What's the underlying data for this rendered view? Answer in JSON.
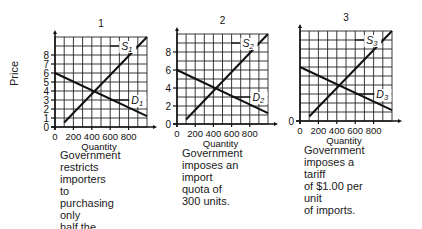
{
  "figure": {
    "y_axis_label": "Price"
  },
  "panels": [
    {
      "number": "1",
      "supply_label": "S",
      "supply_sub": "1",
      "demand_label": "D",
      "demand_sub": "1",
      "y_ticks": [
        "0",
        "1",
        "2",
        "3",
        "4",
        "5",
        "6",
        "7",
        "8"
      ],
      "x_ticks": [
        "0",
        "200",
        "400",
        "600",
        "800"
      ],
      "x_label": "Quantity",
      "caption": [
        "Government",
        "restricts importers",
        "to purchasing only",
        "half the quantity",
        "demanded at each",
        "price."
      ]
    },
    {
      "number": "2",
      "supply_label": "S",
      "supply_sub": "2",
      "demand_label": "D",
      "demand_sub": "2",
      "y_ticks": [
        "0",
        "2",
        "4",
        "6",
        "8"
      ],
      "x_ticks": [
        "0",
        "200",
        "400",
        "600",
        "800"
      ],
      "x_label": "Quantity",
      "caption": [
        "Government",
        "imposes an import",
        "quota of 300 units."
      ]
    },
    {
      "number": "3",
      "supply_label": "S",
      "supply_sub": "3",
      "demand_label": "D",
      "demand_sub": "3",
      "y_ticks": [
        "0"
      ],
      "x_ticks": [
        "0",
        "200",
        "400",
        "600",
        "800"
      ],
      "x_label": "Quantity",
      "caption": [
        "Government",
        "imposes a tariff",
        "of $1.00 per unit",
        "of imports."
      ]
    }
  ],
  "chart_data": [
    {
      "type": "line",
      "title": "1",
      "xlabel": "Quantity",
      "ylabel": "Price",
      "xlim": [
        0,
        1000
      ],
      "ylim": [
        0,
        10
      ],
      "grid": true,
      "x_ticks": [
        0,
        200,
        400,
        600,
        800
      ],
      "y_ticks": [
        0,
        1,
        2,
        3,
        4,
        5,
        6,
        7,
        8
      ],
      "series": [
        {
          "name": "S1",
          "x": [
            100,
            1000
          ],
          "y": [
            0.5,
            10
          ]
        },
        {
          "name": "D1",
          "x": [
            0,
            1000
          ],
          "y": [
            6,
            1.2
          ]
        }
      ],
      "annotations": [
        "Government restricts importers to purchasing only half the quantity demanded at each price."
      ]
    },
    {
      "type": "line",
      "title": "2",
      "xlabel": "Quantity",
      "ylabel": "Price",
      "xlim": [
        0,
        1000
      ],
      "ylim": [
        0,
        10
      ],
      "grid": true,
      "x_ticks": [
        0,
        200,
        400,
        600,
        800
      ],
      "y_ticks": [
        0,
        2,
        4,
        6,
        8
      ],
      "series": [
        {
          "name": "S2",
          "x": [
            100,
            1000
          ],
          "y": [
            0.5,
            10
          ]
        },
        {
          "name": "D2",
          "x": [
            0,
            1000
          ],
          "y": [
            6,
            1.2
          ]
        }
      ],
      "annotations": [
        "Government imposes an import quota of 300 units."
      ]
    },
    {
      "type": "line",
      "title": "3",
      "xlabel": "Quantity",
      "ylabel": "Price",
      "xlim": [
        0,
        1000
      ],
      "ylim": [
        0,
        10
      ],
      "grid": true,
      "x_ticks": [
        0,
        200,
        400,
        600,
        800
      ],
      "y_ticks": [
        0
      ],
      "series": [
        {
          "name": "S3",
          "x": [
            100,
            1000
          ],
          "y": [
            0.5,
            10
          ]
        },
        {
          "name": "D3",
          "x": [
            0,
            1000
          ],
          "y": [
            6,
            1.2
          ]
        }
      ],
      "annotations": [
        "Government imposes a tariff of $1.00 per unit of imports."
      ]
    }
  ]
}
